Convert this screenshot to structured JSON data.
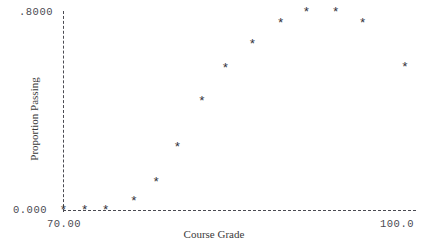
{
  "chart_data": {
    "type": "scatter",
    "title": "",
    "xlabel": "Course Grade",
    "ylabel": "Proportion Passing",
    "xlim": [
      70.0,
      100.0
    ],
    "ylim": [
      0.0,
      0.8
    ],
    "grid": false,
    "legend": null,
    "marker": "*",
    "marker_color": "#33333b",
    "axis_style": "dashed",
    "axis_color": "#4a4a52",
    "background_color": "#ffffff",
    "xticks": [
      {
        "value": 70.0,
        "label": "70.00"
      },
      {
        "value": 100.0,
        "label": "100.0"
      }
    ],
    "yticks": [
      {
        "value": 0.8,
        "label": ".8000"
      },
      {
        "value": 0.0,
        "label": "0.000"
      }
    ],
    "x": [
      70.0,
      71.8,
      73.6,
      76.0,
      77.9,
      79.7,
      81.8,
      83.8,
      86.1,
      88.5,
      90.7,
      93.2,
      95.5,
      99.1
    ],
    "y": [
      0.0,
      0.0,
      0.0,
      0.036,
      0.113,
      0.255,
      0.44,
      0.574,
      0.671,
      0.756,
      0.8,
      0.8,
      0.756,
      0.578
    ],
    "points": [
      {
        "x": 70.0,
        "y": 0.0
      },
      {
        "x": 71.8,
        "y": 0.0
      },
      {
        "x": 73.6,
        "y": 0.0
      },
      {
        "x": 76.0,
        "y": 0.036
      },
      {
        "x": 77.9,
        "y": 0.113
      },
      {
        "x": 79.7,
        "y": 0.255
      },
      {
        "x": 81.8,
        "y": 0.44
      },
      {
        "x": 83.8,
        "y": 0.574
      },
      {
        "x": 86.1,
        "y": 0.671
      },
      {
        "x": 88.5,
        "y": 0.756
      },
      {
        "x": 90.7,
        "y": 0.8
      },
      {
        "x": 93.2,
        "y": 0.8
      },
      {
        "x": 95.5,
        "y": 0.756
      },
      {
        "x": 99.1,
        "y": 0.578
      }
    ]
  }
}
